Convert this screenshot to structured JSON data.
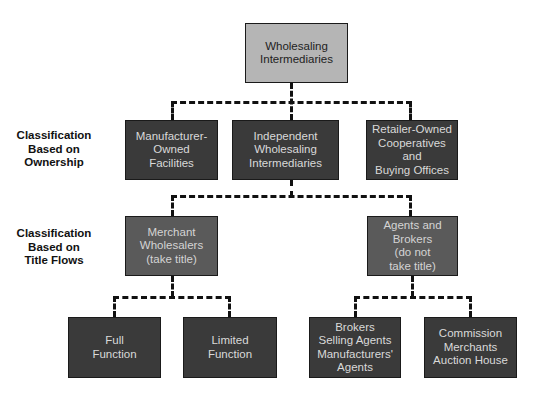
{
  "diagram": {
    "type": "hierarchy",
    "root": {
      "label": "Wholesaling\nIntermediaries"
    },
    "row_labels": [
      {
        "id": "ownership",
        "label": "Classification\nBased on\nOwnership"
      },
      {
        "id": "title_flows",
        "label": "Classification\nBased on\nTitle Flows"
      }
    ],
    "ownership_level": [
      {
        "label": "Manufacturer-\nOwned\nFacilities"
      },
      {
        "label": "Independent\nWholesaling\nIntermediaries"
      },
      {
        "label": "Retailer-Owned\nCooperatives and\nBuying Offices"
      }
    ],
    "title_flow_level": [
      {
        "label": "Merchant\nWholesalers\n(take title)"
      },
      {
        "label": "Agents and\nBrokers\n(do not\ntake title)"
      }
    ],
    "merchant_children": [
      {
        "label": "Full\nFunction"
      },
      {
        "label": "Limited\nFunction"
      }
    ],
    "agent_children": [
      {
        "label": "Brokers\nSelling Agents\nManufacturers'\nAgents"
      },
      {
        "label": "Commission\nMerchants\nAuction House"
      }
    ],
    "colors": {
      "root_fill": "#b5b5b5",
      "dark_fill": "#3a3a3a",
      "mid_fill": "#5a5a5a",
      "connector": "#111111"
    }
  }
}
